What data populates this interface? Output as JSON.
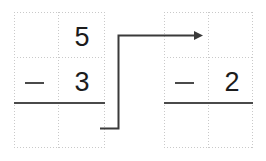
{
  "worksheet": {
    "title": "Two-digit subtraction with regrouping worksheet",
    "description": "Two column-subtraction grids joined by a regrouping arrow",
    "colors": {
      "grid_line": "#c9c9c9",
      "rule_line": "#4a4a4a",
      "digit": "#1c1c1c",
      "arrow": "#3a3a3a",
      "background": "#ffffff"
    }
  },
  "problems": [
    {
      "id": "left-problem",
      "name": "left-subtraction-grid",
      "minuend": "5",
      "operator": "−",
      "subtrahend": "3",
      "answer": "",
      "rows": 3,
      "columns": 2
    },
    {
      "id": "right-problem",
      "name": "right-subtraction-grid",
      "minuend": "",
      "operator": "−",
      "subtrahend": "2",
      "answer": "",
      "rows": 3,
      "columns": 2
    }
  ],
  "connector": {
    "name": "regrouping-arrow",
    "label": "",
    "direction": "left-bottom-to-right-top",
    "has_arrowhead": true
  }
}
